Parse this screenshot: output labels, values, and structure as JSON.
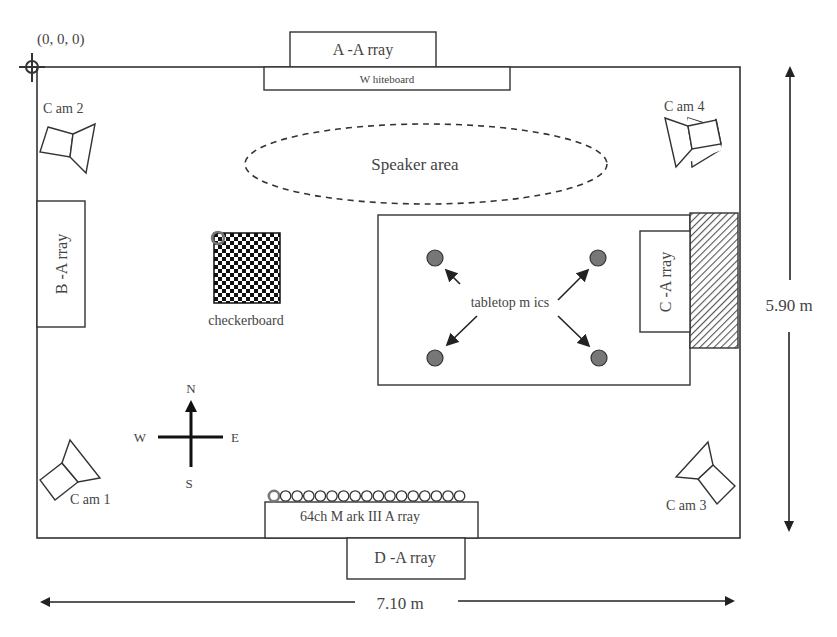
{
  "diagram": {
    "origin_label": "(0, 0, 0)",
    "room": {
      "width_label": "7.10 m",
      "height_label": "5.90 m"
    },
    "arrays": {
      "a": "A -A rray",
      "b": "B -A rray",
      "c": "C -A rray",
      "d": "D -A rray",
      "mark3": "64ch M ark III A rray"
    },
    "whiteboard": "W hiteboard",
    "speaker_area": "Speaker area",
    "checkerboard": "checkerboard",
    "tabletop_mics": "tabletop m ics",
    "cameras": [
      "C am 1",
      "C am 2",
      "C am 3",
      "C am 4"
    ],
    "compass": {
      "n": "N",
      "s": "S",
      "e": "E",
      "w": "W"
    },
    "colors": {
      "line": "#333333",
      "text": "#444444",
      "mic_fill": "#777777",
      "hatch": "#555555"
    },
    "mark3_mic_count": 17
  }
}
